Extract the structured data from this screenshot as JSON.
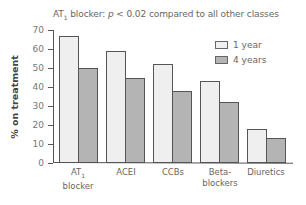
{
  "chart_data": {
    "type": "bar",
    "title": "AT1 blocker: p < 0.02 compared to all other classes",
    "xlabel": "",
    "ylabel": "% on treatment",
    "ylim": [
      0,
      70
    ],
    "yticks": [
      0,
      10,
      20,
      30,
      40,
      50,
      60,
      70
    ],
    "categories": [
      "AT1 blocker",
      "ACEI",
      "CCBs",
      "Beta-blockers",
      "Diuretics"
    ],
    "series": [
      {
        "name": "1 year",
        "color": "#efefef",
        "values": [
          67,
          59,
          52,
          43,
          18
        ]
      },
      {
        "name": "4 years",
        "color": "#b4b4b4",
        "values": [
          50,
          45,
          38,
          32,
          13
        ]
      }
    ],
    "legend_position": "upper right",
    "grid": false
  },
  "title": {
    "prefix": "AT",
    "sub": "1",
    "middle": " blocker: ",
    "p": "p",
    "rest": " < 0.02 compared to all other classes"
  },
  "yaxis": {
    "label": "% on treatment"
  },
  "categories": [
    {
      "line1": "AT",
      "sub": "1",
      "line2": "blocker"
    },
    {
      "line1": "ACEI"
    },
    {
      "line1": "CCBs"
    },
    {
      "line1": "Beta-",
      "line2": "blockers"
    },
    {
      "line1": "Diuretics"
    }
  ],
  "legend": [
    {
      "label": "1 year"
    },
    {
      "label": "4 years"
    }
  ]
}
